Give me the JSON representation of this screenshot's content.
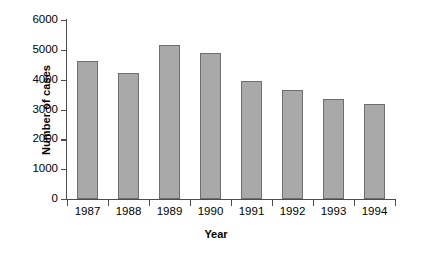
{
  "chart_data": {
    "type": "bar",
    "title": "",
    "xlabel": "Year",
    "ylabel": "Number of cases",
    "categories": [
      "1987",
      "1988",
      "1989",
      "1990",
      "1991",
      "1992",
      "1993",
      "1994"
    ],
    "values": [
      4630,
      4230,
      5160,
      4890,
      3950,
      3640,
      3350,
      3180
    ],
    "ylim": [
      0,
      6000
    ],
    "yticks": [
      0,
      1000,
      2000,
      3000,
      4000,
      5000,
      6000
    ],
    "ytick_labels": [
      "0",
      "1000",
      "2000",
      "3000",
      "4000",
      "5000",
      "6000"
    ],
    "grid": false,
    "legend": null,
    "series": [
      {
        "name": "Number of cases",
        "values": [
          4630,
          4230,
          5160,
          4890,
          3950,
          3640,
          3350,
          3180
        ]
      }
    ]
  },
  "style": {
    "bar_fill": "#a9a9a9",
    "bar_edge": "#6e6e6e",
    "axis_color": "#4d4d4d",
    "text_color": "#000000",
    "background": "#ffffff"
  }
}
